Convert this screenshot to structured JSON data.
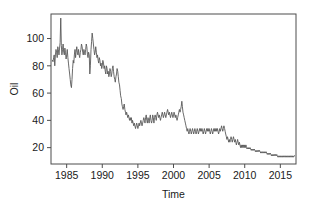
{
  "chart_data": {
    "type": "line",
    "title": "",
    "subtitle": "",
    "xlabel": "Time",
    "ylabel": "Oil",
    "xlim": [
      1982.8,
      2017.2
    ],
    "ylim": [
      8,
      118
    ],
    "grid": false,
    "legend": null,
    "line_color": "#595959",
    "frame_color": "#4d4d4d",
    "background": "#ffffff",
    "xticks": [
      1985,
      1990,
      1995,
      2000,
      2005,
      2010,
      2015
    ],
    "xtick_labels": [
      "1985",
      "1990",
      "1995",
      "2000",
      "2005",
      "2010",
      "2015"
    ],
    "yticks": [
      20,
      40,
      60,
      80,
      100
    ],
    "ytick_labels": [
      "20",
      "40",
      "60",
      "80",
      "100"
    ],
    "series": [
      {
        "name": "Oil",
        "x": [
          1983.0,
          1983.08,
          1983.17,
          1983.25,
          1983.33,
          1983.42,
          1983.5,
          1983.58,
          1983.67,
          1983.75,
          1983.83,
          1983.92,
          1984.0,
          1984.08,
          1984.17,
          1984.25,
          1984.33,
          1984.42,
          1984.5,
          1984.58,
          1984.67,
          1984.75,
          1984.83,
          1984.92,
          1985.0,
          1985.08,
          1985.17,
          1985.25,
          1985.33,
          1985.42,
          1985.5,
          1985.58,
          1985.67,
          1985.75,
          1985.83,
          1985.92,
          1986.0,
          1986.08,
          1986.17,
          1986.25,
          1986.33,
          1986.42,
          1986.5,
          1986.58,
          1986.67,
          1986.75,
          1986.83,
          1986.92,
          1987.0,
          1987.08,
          1987.17,
          1987.25,
          1987.33,
          1987.42,
          1987.5,
          1987.58,
          1987.67,
          1987.75,
          1987.83,
          1987.92,
          1988.0,
          1988.08,
          1988.17,
          1988.25,
          1988.33,
          1988.42,
          1988.5,
          1988.58,
          1988.67,
          1988.75,
          1988.83,
          1988.92,
          1989.0,
          1989.08,
          1989.17,
          1989.25,
          1989.33,
          1989.42,
          1989.5,
          1989.58,
          1989.67,
          1989.75,
          1989.83,
          1989.92,
          1990.0,
          1990.08,
          1990.17,
          1990.25,
          1990.33,
          1990.42,
          1990.5,
          1990.58,
          1990.67,
          1990.75,
          1990.83,
          1990.92,
          1991.0,
          1991.08,
          1991.17,
          1991.25,
          1991.33,
          1991.42,
          1991.5,
          1991.58,
          1991.67,
          1991.75,
          1991.83,
          1991.92,
          1992.0,
          1992.08,
          1992.17,
          1992.25,
          1992.33,
          1992.42,
          1992.5,
          1992.58,
          1992.67,
          1992.75,
          1992.83,
          1992.92,
          1993.0,
          1993.08,
          1993.17,
          1993.25,
          1993.33,
          1993.42,
          1993.5,
          1993.58,
          1993.67,
          1993.75,
          1993.83,
          1993.92,
          1994.0,
          1994.08,
          1994.17,
          1994.25,
          1994.33,
          1994.42,
          1994.5,
          1994.58,
          1994.67,
          1994.75,
          1994.83,
          1994.92,
          1995.0,
          1995.08,
          1995.17,
          1995.25,
          1995.33,
          1995.42,
          1995.5,
          1995.58,
          1995.67,
          1995.75,
          1995.83,
          1995.92,
          1996.0,
          1996.08,
          1996.17,
          1996.25,
          1996.33,
          1996.42,
          1996.5,
          1996.58,
          1996.67,
          1996.75,
          1996.83,
          1996.92,
          1997.0,
          1997.08,
          1997.17,
          1997.25,
          1997.33,
          1997.42,
          1997.5,
          1997.58,
          1997.67,
          1997.75,
          1997.83,
          1997.92,
          1998.0,
          1998.08,
          1998.17,
          1998.25,
          1998.33,
          1998.42,
          1998.5,
          1998.58,
          1998.67,
          1998.75,
          1998.83,
          1998.92,
          1999.0,
          1999.08,
          1999.17,
          1999.25,
          1999.33,
          1999.42,
          1999.5,
          1999.58,
          1999.67,
          1999.75,
          1999.83,
          1999.92,
          2000.0,
          2000.08,
          2000.17,
          2000.25,
          2000.33,
          2000.42,
          2000.5,
          2000.58,
          2000.67,
          2000.75,
          2000.83,
          2000.92,
          2001.0,
          2001.08,
          2001.17,
          2001.25,
          2001.33,
          2001.42,
          2001.5,
          2001.58,
          2001.67,
          2001.75,
          2001.83,
          2001.92,
          2002.0,
          2002.08,
          2002.17,
          2002.25,
          2002.33,
          2002.42,
          2002.5,
          2002.58,
          2002.67,
          2002.75,
          2002.83,
          2002.92,
          2003.0,
          2003.08,
          2003.17,
          2003.25,
          2003.33,
          2003.42,
          2003.5,
          2003.58,
          2003.67,
          2003.75,
          2003.83,
          2003.92,
          2004.0,
          2004.08,
          2004.17,
          2004.25,
          2004.33,
          2004.42,
          2004.5,
          2004.58,
          2004.67,
          2004.75,
          2004.83,
          2004.92,
          2005.0,
          2005.08,
          2005.17,
          2005.25,
          2005.33,
          2005.42,
          2005.5,
          2005.58,
          2005.67,
          2005.75,
          2005.83,
          2005.92,
          2006.0,
          2006.08,
          2006.17,
          2006.25,
          2006.33,
          2006.42,
          2006.5,
          2006.58,
          2006.67,
          2006.75,
          2006.83,
          2006.92,
          2007.0,
          2007.08,
          2007.17,
          2007.25,
          2007.33,
          2007.42,
          2007.5,
          2007.58,
          2007.67,
          2007.75,
          2007.83,
          2007.92,
          2008.0,
          2008.08,
          2008.17,
          2008.25,
          2008.33,
          2008.42,
          2008.5,
          2008.58,
          2008.67,
          2008.75,
          2008.83,
          2008.92,
          2009.0,
          2009.08,
          2009.17,
          2009.25,
          2009.33,
          2009.42,
          2009.5,
          2009.58,
          2009.67,
          2009.75,
          2009.83,
          2009.92,
          2010.0,
          2010.08,
          2010.17,
          2010.25,
          2010.33,
          2010.42,
          2010.5,
          2010.58,
          2010.67,
          2010.75,
          2010.83,
          2010.92,
          2011.0,
          2011.08,
          2011.17,
          2011.25,
          2011.33,
          2011.42,
          2011.5,
          2011.58,
          2011.67,
          2011.75,
          2011.83,
          2011.92,
          2012.0,
          2012.08,
          2012.17,
          2012.25,
          2012.33,
          2012.42,
          2012.5,
          2012.58,
          2012.67,
          2012.75,
          2012.83,
          2012.92,
          2013.0,
          2013.08,
          2013.17,
          2013.25,
          2013.33,
          2013.42,
          2013.5,
          2013.58,
          2013.67,
          2013.75,
          2013.83,
          2013.92,
          2014.0,
          2014.08,
          2014.17,
          2014.25,
          2014.33,
          2014.42,
          2014.5,
          2014.58,
          2014.67,
          2014.75,
          2014.83,
          2014.92,
          2015.0,
          2015.08,
          2015.17,
          2015.25,
          2015.33,
          2015.42,
          2015.5,
          2015.58,
          2015.67,
          2015.75,
          2015.83,
          2015.92,
          2016.0,
          2016.08,
          2016.17,
          2016.25,
          2016.33,
          2016.42,
          2016.5,
          2016.58,
          2016.67,
          2016.75,
          2016.83,
          2016.92,
          2017.0
        ],
        "values": [
          84,
          83,
          86,
          88,
          80,
          88,
          92,
          90,
          86,
          94,
          92,
          88,
          93,
          97,
          115,
          95,
          88,
          92,
          96,
          90,
          88,
          93,
          90,
          85,
          88,
          92,
          86,
          82,
          78,
          74,
          70,
          66,
          64,
          70,
          78,
          84,
          82,
          88,
          92,
          86,
          90,
          94,
          90,
          88,
          92,
          88,
          86,
          90,
          92,
          96,
          94,
          90,
          88,
          92,
          90,
          88,
          92,
          96,
          94,
          88,
          86,
          90,
          88,
          74,
          80,
          92,
          98,
          104,
          100,
          96,
          92,
          88,
          90,
          94,
          90,
          86,
          88,
          84,
          82,
          86,
          84,
          80,
          82,
          78,
          80,
          84,
          82,
          78,
          80,
          76,
          74,
          80,
          78,
          74,
          76,
          72,
          74,
          78,
          76,
          72,
          74,
          78,
          80,
          76,
          72,
          70,
          68,
          72,
          74,
          78,
          76,
          72,
          68,
          66,
          62,
          58,
          56,
          52,
          50,
          48,
          50,
          52,
          48,
          46,
          44,
          46,
          44,
          42,
          44,
          42,
          40,
          42,
          40,
          42,
          38,
          40,
          38,
          36,
          38,
          36,
          34,
          36,
          38,
          36,
          34,
          36,
          38,
          36,
          38,
          40,
          38,
          36,
          38,
          40,
          42,
          40,
          38,
          42,
          44,
          40,
          38,
          42,
          40,
          38,
          42,
          44,
          40,
          38,
          40,
          44,
          42,
          38,
          42,
          44,
          42,
          40,
          44,
          46,
          44,
          42,
          44,
          42,
          40,
          42,
          44,
          46,
          44,
          42,
          44,
          46,
          44,
          42,
          44,
          46,
          48,
          46,
          44,
          46,
          44,
          42,
          44,
          46,
          44,
          42,
          44,
          46,
          44,
          42,
          44,
          42,
          40,
          42,
          44,
          46,
          48,
          46,
          48,
          50,
          54,
          50,
          46,
          44,
          42,
          40,
          38,
          36,
          34,
          32,
          34,
          32,
          30,
          32,
          34,
          32,
          30,
          32,
          34,
          32,
          30,
          32,
          34,
          32,
          30,
          32,
          34,
          32,
          30,
          32,
          34,
          32,
          34,
          32,
          34,
          32,
          30,
          32,
          34,
          32,
          30,
          32,
          34,
          32,
          34,
          32,
          34,
          32,
          30,
          32,
          34,
          32,
          30,
          32,
          34,
          32,
          34,
          32,
          34,
          32,
          34,
          32,
          30,
          32,
          34,
          32,
          34,
          36,
          34,
          32,
          34,
          36,
          34,
          32,
          30,
          28,
          26,
          28,
          26,
          24,
          26,
          24,
          26,
          28,
          26,
          24,
          26,
          28,
          26,
          24,
          26,
          24,
          22,
          24,
          26,
          24,
          22,
          24,
          22,
          20,
          22,
          20,
          22,
          20,
          22,
          20,
          22,
          20,
          22,
          20,
          19,
          20,
          19,
          20,
          19,
          20,
          19,
          18,
          19,
          18,
          19,
          18,
          19,
          18,
          17,
          18,
          17,
          18,
          17,
          18,
          17,
          18,
          17,
          16,
          17,
          16,
          17,
          16,
          17,
          16,
          17,
          16,
          17,
          16,
          15,
          16,
          15,
          16,
          15,
          16,
          15,
          14,
          15,
          14,
          15,
          14,
          15,
          14,
          15,
          14,
          15,
          14,
          13,
          14,
          13,
          14,
          13,
          14,
          13,
          14,
          13,
          14,
          13,
          14,
          13,
          14,
          13,
          14,
          13,
          14,
          13,
          14,
          13,
          14,
          13,
          14,
          13,
          14,
          13,
          14,
          14
        ]
      }
    ]
  }
}
